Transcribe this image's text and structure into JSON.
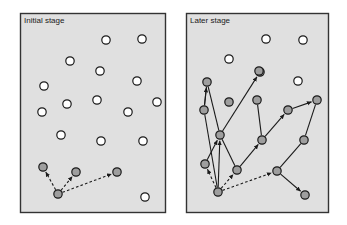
{
  "figure": {
    "type": "diagram",
    "background_color": "#ffffff",
    "panel_fill": "#e0e0e0",
    "panel_border_color": "#333333",
    "node_open_fill": "#ffffff",
    "node_filled_fill": "#9e9e9e",
    "node_stroke_color": "#1a1a1a",
    "node_radius": 4.2,
    "edge_color": "#1a1a1a"
  },
  "panels": [
    {
      "id": "initial",
      "title": "Initial stage",
      "title_x": 24,
      "title_y": 17,
      "frame": {
        "x": 20,
        "y": 13,
        "width": 145,
        "height": 199
      },
      "open_nodes": [
        {
          "id": "o1",
          "x": 106,
          "y": 40
        },
        {
          "id": "o2",
          "x": 142,
          "y": 39
        },
        {
          "id": "o3",
          "x": 70,
          "y": 61
        },
        {
          "id": "o4",
          "x": 100,
          "y": 71
        },
        {
          "id": "o5",
          "x": 137,
          "y": 81
        },
        {
          "id": "o6",
          "x": 44,
          "y": 86
        },
        {
          "id": "o7",
          "x": 97,
          "y": 100
        },
        {
          "id": "o8",
          "x": 157,
          "y": 102
        },
        {
          "id": "o9",
          "x": 67,
          "y": 104
        },
        {
          "id": "o10",
          "x": 128,
          "y": 112
        },
        {
          "id": "o11",
          "x": 42,
          "y": 112
        },
        {
          "id": "o12",
          "x": 61,
          "y": 135
        },
        {
          "id": "o13",
          "x": 101,
          "y": 141
        },
        {
          "id": "o14",
          "x": 143,
          "y": 141
        },
        {
          "id": "o15",
          "x": 145,
          "y": 197
        }
      ],
      "filled_nodes": [
        {
          "id": "f1",
          "x": 43,
          "y": 167
        },
        {
          "id": "f2",
          "x": 76,
          "y": 172
        },
        {
          "id": "f3",
          "x": 117,
          "y": 172
        },
        {
          "id": "f4",
          "x": 58,
          "y": 194
        }
      ],
      "solid_edges": [],
      "dashed_edges": [
        {
          "from": "f4",
          "to": "f1",
          "arrow": true
        },
        {
          "from": "f4",
          "to": "f2",
          "arrow": true
        },
        {
          "from": "f4",
          "to": "f3",
          "arrow": true
        }
      ]
    },
    {
      "id": "later",
      "title": "Later stage",
      "title_x": 190,
      "title_y": 17,
      "frame": {
        "x": 186,
        "y": 13,
        "width": 142,
        "height": 199
      },
      "open_nodes": [
        {
          "id": "p1",
          "x": 266,
          "y": 39
        },
        {
          "id": "p2",
          "x": 303,
          "y": 40
        },
        {
          "id": "p3",
          "x": 229,
          "y": 59
        },
        {
          "id": "p4",
          "x": 298,
          "y": 81
        }
      ],
      "filled_nodes": [
        {
          "id": "n1",
          "x": 260,
          "y": 72
        },
        {
          "id": "n2",
          "x": 207,
          "y": 82
        },
        {
          "id": "n3",
          "x": 259,
          "y": 71
        },
        {
          "id": "n4",
          "x": 229,
          "y": 102
        },
        {
          "id": "n5",
          "x": 204,
          "y": 110
        },
        {
          "id": "n6",
          "x": 257,
          "y": 100
        },
        {
          "id": "n7",
          "x": 317,
          "y": 100
        },
        {
          "id": "n8",
          "x": 288,
          "y": 110
        },
        {
          "id": "n9",
          "x": 220,
          "y": 135
        },
        {
          "id": "n10",
          "x": 262,
          "y": 140
        },
        {
          "id": "n11",
          "x": 304,
          "y": 140
        },
        {
          "id": "n12",
          "x": 205,
          "y": 164
        },
        {
          "id": "n13",
          "x": 237,
          "y": 170
        },
        {
          "id": "n14",
          "x": 277,
          "y": 171
        },
        {
          "id": "n15",
          "x": 218,
          "y": 192
        },
        {
          "id": "n16",
          "x": 305,
          "y": 195
        }
      ],
      "solid_edges": [
        {
          "from": "n2",
          "to": "n5",
          "arrow": false
        },
        {
          "from": "n5",
          "to": "n2",
          "arrow": true
        },
        {
          "from": "n2",
          "to": "n9",
          "arrow": false
        },
        {
          "from": "n9",
          "to": "n1",
          "arrow": true
        },
        {
          "from": "n5",
          "to": "n15",
          "arrow": false
        },
        {
          "from": "n15",
          "to": "n9",
          "arrow": true
        },
        {
          "from": "n9",
          "to": "n13",
          "arrow": false
        },
        {
          "from": "n13",
          "to": "n10",
          "arrow": true
        },
        {
          "from": "n6",
          "to": "n10",
          "arrow": false
        },
        {
          "from": "n10",
          "to": "n8",
          "arrow": true
        },
        {
          "from": "n8",
          "to": "n7",
          "arrow": true
        },
        {
          "from": "n7",
          "to": "n11",
          "arrow": false
        },
        {
          "from": "n11",
          "to": "n14",
          "arrow": false
        },
        {
          "from": "n14",
          "to": "n16",
          "arrow": true
        },
        {
          "from": "n12",
          "to": "n9",
          "arrow": true
        }
      ],
      "dashed_edges": [
        {
          "from": "n15",
          "to": "n12",
          "arrow": true
        },
        {
          "from": "n15",
          "to": "n13",
          "arrow": true
        },
        {
          "from": "n15",
          "to": "n14",
          "arrow": true
        }
      ]
    }
  ]
}
